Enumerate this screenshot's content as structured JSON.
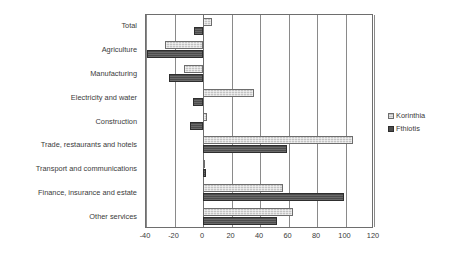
{
  "chart_data": {
    "type": "bar",
    "orientation": "horizontal",
    "title": "",
    "subtitle": "",
    "xlabel": "",
    "ylabel": "",
    "xlim": [
      -40,
      120
    ],
    "xticks": [
      "-40",
      "-20",
      "0",
      "20",
      "40",
      "60",
      "80",
      "100",
      "120"
    ],
    "grid": true,
    "legend_position": "right",
    "categories": [
      "Total",
      "Agriculture",
      "Manufacturing",
      "Electricity and water",
      "Construction",
      "Trade, restaurants and hotels",
      "Transport and communications",
      "Finance, insurance and estate",
      "Other services"
    ],
    "series": [
      {
        "name": "Korinthia",
        "color": "#c3c3c3",
        "values": [
          6,
          -27,
          -13,
          36,
          3,
          105,
          1,
          56,
          63
        ]
      },
      {
        "name": "Fthiotis",
        "color": "#4c4c4c",
        "values": [
          -6,
          -39,
          -24,
          -7,
          -9,
          59,
          2,
          99,
          52
        ]
      }
    ]
  },
  "legend": {
    "items": [
      {
        "label": "Korinthia",
        "swatch": "legend-swatch-korinthia"
      },
      {
        "label": "Fthiotis",
        "swatch": "legend-swatch-fthiotis"
      }
    ]
  }
}
